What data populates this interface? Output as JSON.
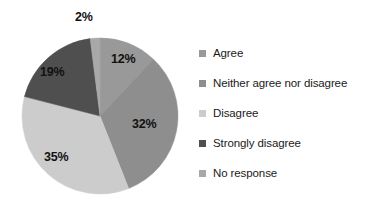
{
  "chart_data": {
    "type": "pie",
    "title": "",
    "categories": [
      "Agree",
      "Neither agree nor disagree",
      "Disagree",
      "Strongly disagree",
      "No response"
    ],
    "values": [
      12,
      35,
      32,
      19,
      2
    ],
    "value_labels": [
      "12%",
      "32%",
      "35%",
      "19%",
      "2%"
    ],
    "slices": [
      {
        "label": "Agree",
        "value": 12,
        "display": "12%",
        "color": "#999999",
        "label_position": "inside"
      },
      {
        "label": "Neither agree nor disagree",
        "value": 32,
        "display": "32%",
        "color": "#8e8e8e",
        "label_position": "inside"
      },
      {
        "label": "Disagree",
        "value": 35,
        "display": "35%",
        "color": "#cccccc",
        "label_position": "inside"
      },
      {
        "label": "Strongly disagree",
        "value": 19,
        "display": "19%",
        "color": "#4f4f4f",
        "label_position": "inside"
      },
      {
        "label": "No response",
        "value": 2,
        "display": "2%",
        "color": "#a8a8a8",
        "label_position": "outside"
      }
    ],
    "legend": {
      "position": "right",
      "entries": [
        {
          "label": "Agree",
          "color": "#999999"
        },
        {
          "label": "Neither agree nor disagree",
          "color": "#8e8e8e"
        },
        {
          "label": "Disagree",
          "color": "#cccccc"
        },
        {
          "label": "Strongly disagree",
          "color": "#4f4f4f"
        },
        {
          "label": "No response",
          "color": "#a8a8a8"
        }
      ]
    },
    "start_angle_deg": -90,
    "direction": "clockwise",
    "grid": false,
    "background": "#ffffff"
  }
}
